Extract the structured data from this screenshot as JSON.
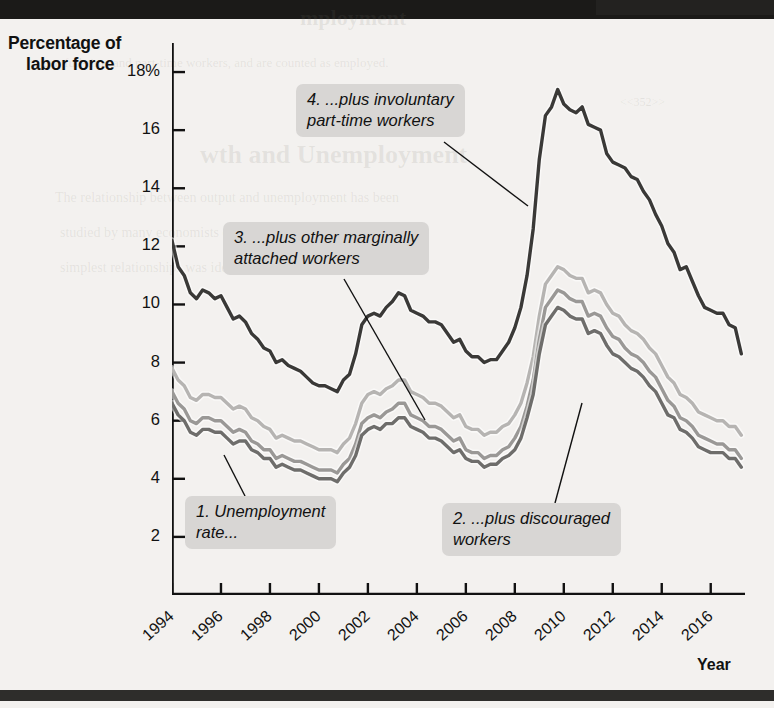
{
  "page": {
    "background_color": "#f3f1ef",
    "bar_color": "#1b1a18"
  },
  "axis": {
    "y_title_line1": "Percentage of",
    "y_title_line2": "labor force",
    "x_title": "Year"
  },
  "chart_data": {
    "type": "line",
    "title": "",
    "xlabel": "Year",
    "ylabel": "Percentage of labor force",
    "grid": false,
    "legend": "annotations",
    "xlim": [
      1994,
      2017.4
    ],
    "ylim": [
      0,
      19
    ],
    "y_ticks": [
      "18%",
      "16",
      "14",
      "12",
      "10",
      "8",
      "6",
      "4",
      "2"
    ],
    "y_tick_values": [
      18,
      16,
      14,
      12,
      10,
      8,
      6,
      4,
      2
    ],
    "x_ticks": [
      "1994",
      "1996",
      "1998",
      "2000",
      "2002",
      "2004",
      "2006",
      "2008",
      "2010",
      "2012",
      "2014",
      "2016"
    ],
    "x_tick_values": [
      1994,
      1996,
      1998,
      2000,
      2002,
      2004,
      2006,
      2008,
      2010,
      2012,
      2014,
      2016
    ],
    "series": [
      {
        "name": "1. Unemployment rate (U-3)",
        "color": "#6e6d6b",
        "annotation_id": 1,
        "x": [
          1994.0,
          1994.25,
          1994.5,
          1994.75,
          1995.0,
          1995.25,
          1995.5,
          1995.75,
          1996.0,
          1996.25,
          1996.5,
          1996.75,
          1997.0,
          1997.25,
          1997.5,
          1997.75,
          1998.0,
          1998.25,
          1998.5,
          1998.75,
          1999.0,
          1999.25,
          1999.5,
          1999.75,
          2000.0,
          2000.25,
          2000.5,
          2000.75,
          2001.0,
          2001.25,
          2001.5,
          2001.75,
          2002.0,
          2002.25,
          2002.5,
          2002.75,
          2003.0,
          2003.25,
          2003.5,
          2003.75,
          2004.0,
          2004.25,
          2004.5,
          2004.75,
          2005.0,
          2005.25,
          2005.5,
          2005.75,
          2006.0,
          2006.25,
          2006.5,
          2006.75,
          2007.0,
          2007.25,
          2007.5,
          2007.75,
          2008.0,
          2008.25,
          2008.5,
          2008.75,
          2009.0,
          2009.25,
          2009.5,
          2009.75,
          2010.0,
          2010.25,
          2010.5,
          2010.75,
          2011.0,
          2011.25,
          2011.5,
          2011.75,
          2012.0,
          2012.25,
          2012.5,
          2012.75,
          2013.0,
          2013.25,
          2013.5,
          2013.75,
          2014.0,
          2014.25,
          2014.5,
          2014.75,
          2015.0,
          2015.25,
          2015.5,
          2015.75,
          2016.0,
          2016.25,
          2016.5,
          2016.75,
          2017.0,
          2017.25
        ],
        "values": [
          6.6,
          6.2,
          6.0,
          5.6,
          5.5,
          5.7,
          5.7,
          5.6,
          5.6,
          5.4,
          5.2,
          5.3,
          5.3,
          5.0,
          4.9,
          4.7,
          4.7,
          4.4,
          4.5,
          4.4,
          4.3,
          4.3,
          4.2,
          4.1,
          4.0,
          4.0,
          4.0,
          3.9,
          4.2,
          4.4,
          4.8,
          5.5,
          5.7,
          5.8,
          5.7,
          5.9,
          5.9,
          6.1,
          6.1,
          5.8,
          5.7,
          5.6,
          5.4,
          5.4,
          5.3,
          5.1,
          4.9,
          5.0,
          4.7,
          4.6,
          4.6,
          4.4,
          4.5,
          4.5,
          4.7,
          4.8,
          5.0,
          5.4,
          6.1,
          6.9,
          8.3,
          9.3,
          9.6,
          9.9,
          9.8,
          9.6,
          9.5,
          9.5,
          9.0,
          9.1,
          9.0,
          8.6,
          8.3,
          8.2,
          8.0,
          7.8,
          7.7,
          7.5,
          7.2,
          7.0,
          6.6,
          6.2,
          6.1,
          5.7,
          5.6,
          5.4,
          5.1,
          5.0,
          4.9,
          4.9,
          4.9,
          4.7,
          4.7,
          4.4
        ]
      },
      {
        "name": "2. ...plus discouraged workers (U-4)",
        "color": "#9a9896",
        "annotation_id": 2,
        "x": [
          1994.0,
          1994.25,
          1994.5,
          1994.75,
          1995.0,
          1995.25,
          1995.5,
          1995.75,
          1996.0,
          1996.25,
          1996.5,
          1996.75,
          1997.0,
          1997.25,
          1997.5,
          1997.75,
          1998.0,
          1998.25,
          1998.5,
          1998.75,
          1999.0,
          1999.25,
          1999.5,
          1999.75,
          2000.0,
          2000.25,
          2000.5,
          2000.75,
          2001.0,
          2001.25,
          2001.5,
          2001.75,
          2002.0,
          2002.25,
          2002.5,
          2002.75,
          2003.0,
          2003.25,
          2003.5,
          2003.75,
          2004.0,
          2004.25,
          2004.5,
          2004.75,
          2005.0,
          2005.25,
          2005.5,
          2005.75,
          2006.0,
          2006.25,
          2006.5,
          2006.75,
          2007.0,
          2007.25,
          2007.5,
          2007.75,
          2008.0,
          2008.25,
          2008.5,
          2008.75,
          2009.0,
          2009.25,
          2009.5,
          2009.75,
          2010.0,
          2010.25,
          2010.5,
          2010.75,
          2011.0,
          2011.25,
          2011.5,
          2011.75,
          2012.0,
          2012.25,
          2012.5,
          2012.75,
          2013.0,
          2013.25,
          2013.5,
          2013.75,
          2014.0,
          2014.25,
          2014.5,
          2014.75,
          2015.0,
          2015.25,
          2015.5,
          2015.75,
          2016.0,
          2016.25,
          2016.5,
          2016.75,
          2017.0,
          2017.25
        ],
        "values": [
          7.0,
          6.6,
          6.4,
          6.0,
          5.9,
          6.1,
          6.1,
          6.0,
          6.0,
          5.8,
          5.6,
          5.7,
          5.6,
          5.3,
          5.2,
          5.0,
          5.0,
          4.7,
          4.8,
          4.7,
          4.6,
          4.6,
          4.5,
          4.4,
          4.3,
          4.3,
          4.3,
          4.2,
          4.5,
          4.7,
          5.2,
          5.9,
          6.1,
          6.2,
          6.1,
          6.3,
          6.4,
          6.6,
          6.6,
          6.2,
          6.1,
          6.0,
          5.8,
          5.8,
          5.7,
          5.5,
          5.3,
          5.4,
          5.0,
          4.9,
          4.9,
          4.7,
          4.8,
          4.8,
          5.0,
          5.1,
          5.4,
          5.8,
          6.5,
          7.4,
          8.8,
          9.9,
          10.2,
          10.5,
          10.4,
          10.2,
          10.1,
          10.1,
          9.6,
          9.7,
          9.6,
          9.2,
          8.9,
          8.8,
          8.5,
          8.3,
          8.2,
          8.0,
          7.7,
          7.5,
          7.1,
          6.7,
          6.5,
          6.1,
          6.0,
          5.8,
          5.5,
          5.4,
          5.3,
          5.2,
          5.2,
          5.0,
          5.0,
          4.7
        ]
      },
      {
        "name": "3. ...plus other marginally attached workers (U-5)",
        "color": "#b6b4b2",
        "annotation_id": 3,
        "x": [
          1994.0,
          1994.25,
          1994.5,
          1994.75,
          1995.0,
          1995.25,
          1995.5,
          1995.75,
          1996.0,
          1996.25,
          1996.5,
          1996.75,
          1997.0,
          1997.25,
          1997.5,
          1997.75,
          1998.0,
          1998.25,
          1998.5,
          1998.75,
          1999.0,
          1999.25,
          1999.5,
          1999.75,
          2000.0,
          2000.25,
          2000.5,
          2000.75,
          2001.0,
          2001.25,
          2001.5,
          2001.75,
          2002.0,
          2002.25,
          2002.5,
          2002.75,
          2003.0,
          2003.25,
          2003.5,
          2003.75,
          2004.0,
          2004.25,
          2004.5,
          2004.75,
          2005.0,
          2005.25,
          2005.5,
          2005.75,
          2006.0,
          2006.25,
          2006.5,
          2006.75,
          2007.0,
          2007.25,
          2007.5,
          2007.75,
          2008.0,
          2008.25,
          2008.5,
          2008.75,
          2009.0,
          2009.25,
          2009.5,
          2009.75,
          2010.0,
          2010.25,
          2010.5,
          2010.75,
          2011.0,
          2011.25,
          2011.5,
          2011.75,
          2012.0,
          2012.25,
          2012.5,
          2012.75,
          2013.0,
          2013.25,
          2013.5,
          2013.75,
          2014.0,
          2014.25,
          2014.5,
          2014.75,
          2015.0,
          2015.25,
          2015.5,
          2015.75,
          2016.0,
          2016.25,
          2016.5,
          2016.75,
          2017.0,
          2017.25
        ],
        "values": [
          7.8,
          7.4,
          7.2,
          6.8,
          6.7,
          6.9,
          6.9,
          6.8,
          6.8,
          6.6,
          6.4,
          6.5,
          6.4,
          6.1,
          6.0,
          5.8,
          5.7,
          5.4,
          5.5,
          5.4,
          5.3,
          5.3,
          5.2,
          5.1,
          5.0,
          5.0,
          5.0,
          4.9,
          5.2,
          5.4,
          5.9,
          6.6,
          6.9,
          7.0,
          6.9,
          7.1,
          7.2,
          7.4,
          7.4,
          7.0,
          6.9,
          6.8,
          6.6,
          6.6,
          6.5,
          6.3,
          6.1,
          6.2,
          5.8,
          5.7,
          5.7,
          5.5,
          5.6,
          5.6,
          5.8,
          5.9,
          6.2,
          6.6,
          7.3,
          8.2,
          9.6,
          10.7,
          11.0,
          11.3,
          11.2,
          11.0,
          10.9,
          10.9,
          10.4,
          10.5,
          10.4,
          10.0,
          9.7,
          9.6,
          9.3,
          9.1,
          9.0,
          8.8,
          8.5,
          8.3,
          7.9,
          7.5,
          7.3,
          6.9,
          6.8,
          6.6,
          6.3,
          6.2,
          6.1,
          6.0,
          6.0,
          5.8,
          5.8,
          5.5
        ]
      },
      {
        "name": "4. ...plus involuntary part-time workers (U-6)",
        "color": "#3a3937",
        "annotation_id": 4,
        "x": [
          1994.0,
          1994.25,
          1994.5,
          1994.75,
          1995.0,
          1995.25,
          1995.5,
          1995.75,
          1996.0,
          1996.25,
          1996.5,
          1996.75,
          1997.0,
          1997.25,
          1997.5,
          1997.75,
          1998.0,
          1998.25,
          1998.5,
          1998.75,
          1999.0,
          1999.25,
          1999.5,
          1999.75,
          2000.0,
          2000.25,
          2000.5,
          2000.75,
          2001.0,
          2001.25,
          2001.5,
          2001.75,
          2002.0,
          2002.25,
          2002.5,
          2002.75,
          2003.0,
          2003.25,
          2003.5,
          2003.75,
          2004.0,
          2004.25,
          2004.5,
          2004.75,
          2005.0,
          2005.25,
          2005.5,
          2005.75,
          2006.0,
          2006.25,
          2006.5,
          2006.75,
          2007.0,
          2007.25,
          2007.5,
          2007.75,
          2008.0,
          2008.25,
          2008.5,
          2008.75,
          2009.0,
          2009.25,
          2009.5,
          2009.75,
          2010.0,
          2010.25,
          2010.5,
          2010.75,
          2011.0,
          2011.25,
          2011.5,
          2011.75,
          2012.0,
          2012.25,
          2012.5,
          2012.75,
          2013.0,
          2013.25,
          2013.5,
          2013.75,
          2014.0,
          2014.25,
          2014.5,
          2014.75,
          2015.0,
          2015.25,
          2015.5,
          2015.75,
          2016.0,
          2016.25,
          2016.5,
          2016.75,
          2017.0,
          2017.25
        ],
        "values": [
          12.2,
          11.3,
          11.0,
          10.4,
          10.2,
          10.5,
          10.4,
          10.2,
          10.3,
          9.9,
          9.5,
          9.6,
          9.4,
          9.0,
          8.8,
          8.5,
          8.4,
          8.0,
          8.1,
          7.9,
          7.8,
          7.7,
          7.5,
          7.3,
          7.2,
          7.2,
          7.1,
          7.0,
          7.4,
          7.6,
          8.3,
          9.3,
          9.6,
          9.7,
          9.6,
          9.9,
          10.1,
          10.4,
          10.3,
          9.8,
          9.7,
          9.6,
          9.4,
          9.4,
          9.3,
          9.0,
          8.7,
          8.8,
          8.4,
          8.2,
          8.2,
          8.0,
          8.1,
          8.1,
          8.4,
          8.7,
          9.2,
          9.9,
          11.0,
          12.6,
          15.0,
          16.5,
          16.8,
          17.4,
          16.9,
          16.7,
          16.6,
          16.8,
          16.2,
          16.1,
          16.0,
          15.2,
          14.9,
          14.8,
          14.7,
          14.4,
          14.3,
          13.9,
          13.6,
          13.1,
          12.7,
          12.1,
          11.8,
          11.2,
          11.3,
          10.8,
          10.3,
          9.9,
          9.8,
          9.7,
          9.7,
          9.3,
          9.2,
          8.3
        ]
      }
    ],
    "annotations": [
      {
        "id": 1,
        "text": "1. Unemployment\nrate...",
        "box": {
          "x": 185,
          "y": 496,
          "w": 186,
          "h": 56
        },
        "leader": {
          "x1": 245,
          "y1": 496,
          "x2": 224,
          "y2": 455
        }
      },
      {
        "id": 2,
        "text": "2. ...plus discouraged\nworkers",
        "box": {
          "x": 442,
          "y": 503,
          "w": 215,
          "h": 56
        },
        "leader": {
          "x1": 555,
          "y1": 503,
          "x2": 582,
          "y2": 403
        }
      },
      {
        "id": 3,
        "text": "3. ...plus other marginally\nattached workers",
        "box": {
          "x": 223,
          "y": 222,
          "w": 262,
          "h": 56
        },
        "leader": {
          "x1": 344,
          "y1": 279,
          "x2": 425,
          "y2": 420
        }
      },
      {
        "id": 4,
        "text": "4. ...plus involuntary\npart-time workers",
        "box": {
          "x": 296,
          "y": 84,
          "w": 214,
          "h": 56
        },
        "leader": {
          "x1": 444,
          "y1": 142,
          "x2": 528,
          "y2": 206
        }
      }
    ]
  }
}
